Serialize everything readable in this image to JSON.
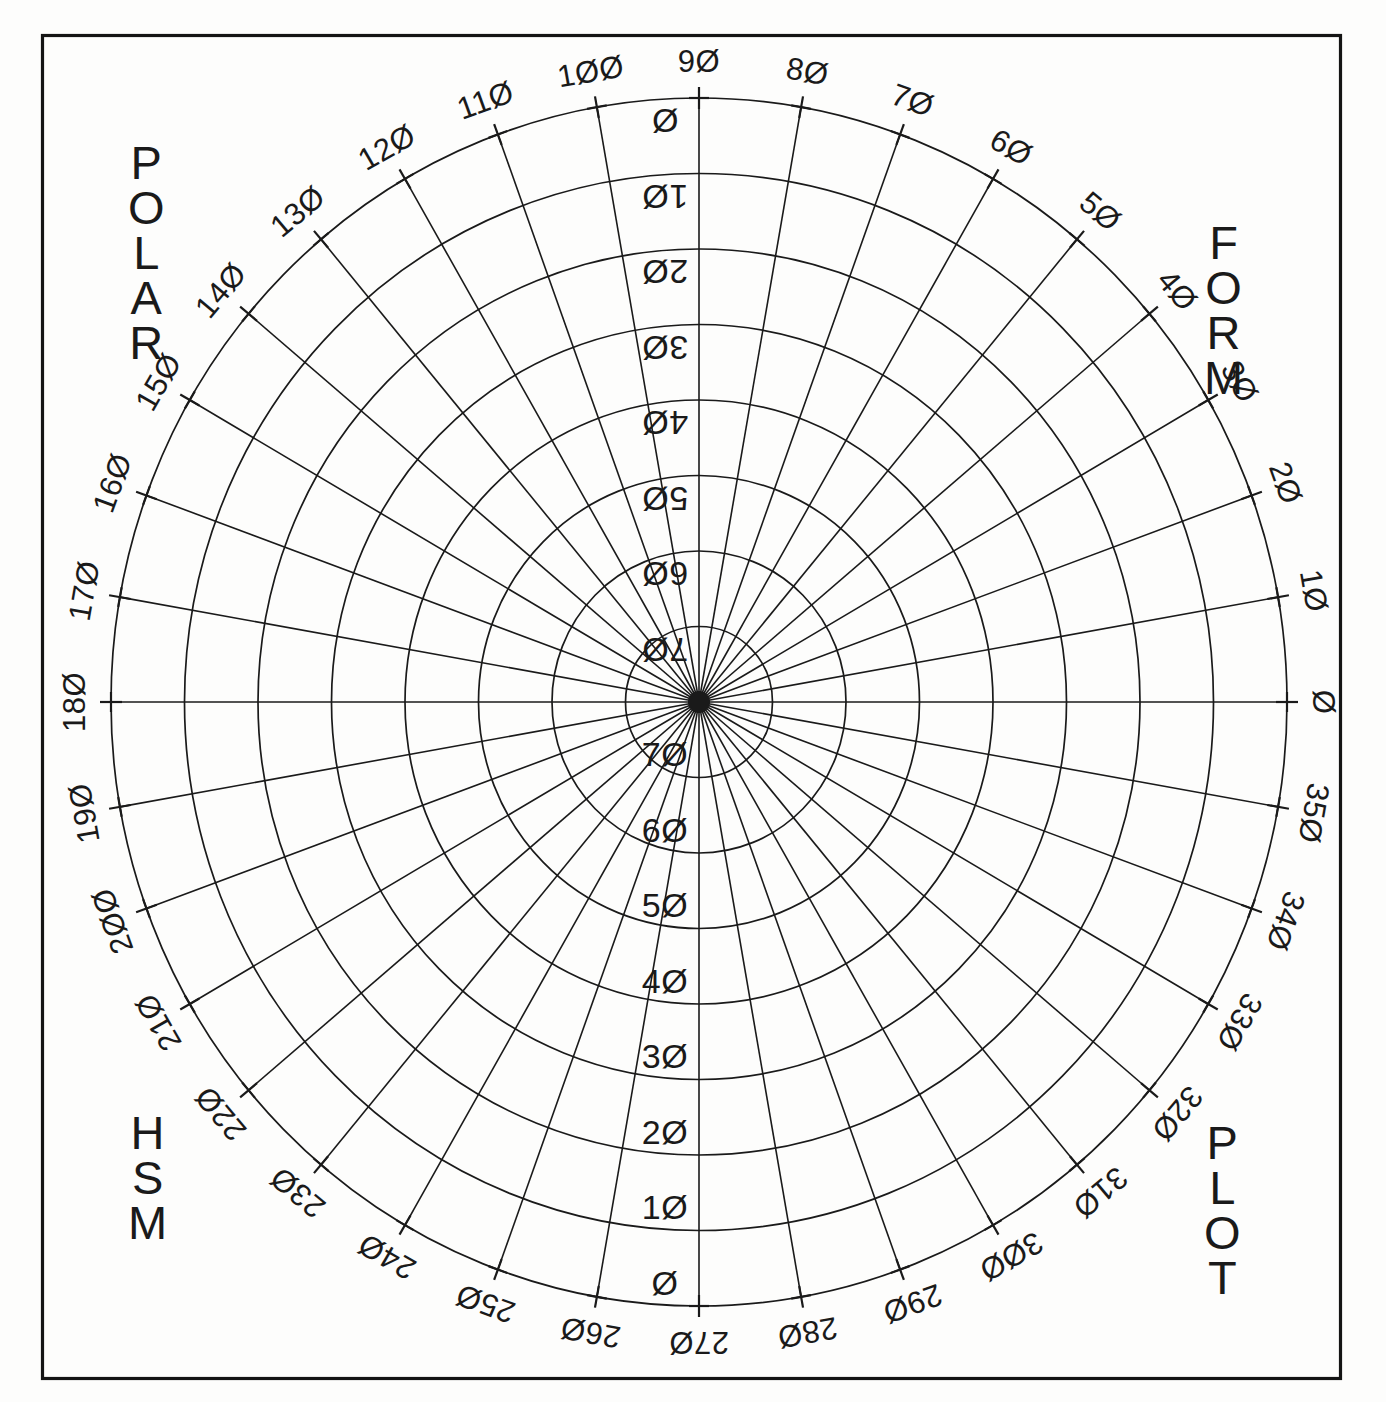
{
  "sheet": {
    "background_color": "#fdfdfc",
    "ink_color": "#1a1a1a",
    "border_color": "#141414"
  },
  "corner_labels": {
    "top_left": "POLAR",
    "top_right": "FORM",
    "bottom_left": "HSM",
    "bottom_right": "PLOT"
  },
  "chart_data": {
    "type": "line",
    "subtitle": "",
    "xlabel": "",
    "ylabel": "",
    "grid": true,
    "legend_position": "none",
    "projection": "polar",
    "center": {
      "x": 699,
      "y": 702
    },
    "radius_x": 588,
    "radius_y": 604,
    "angular_axis": {
      "label": "",
      "unit": "degrees",
      "range": [
        0,
        360
      ],
      "tick_step": 10,
      "zero_direction": "east",
      "direction": "counterclockwise",
      "tick_labels": [
        "0",
        "10",
        "20",
        "30",
        "40",
        "50",
        "60",
        "70",
        "80",
        "90",
        "100",
        "110",
        "120",
        "130",
        "140",
        "150",
        "160",
        "170",
        "180",
        "190",
        "200",
        "210",
        "220",
        "230",
        "240",
        "250",
        "260",
        "270",
        "280",
        "290",
        "300",
        "310",
        "320",
        "330",
        "340",
        "350"
      ]
    },
    "radial_axis": {
      "label": "",
      "range": [
        0,
        80
      ],
      "tick_step": 10,
      "ring_count": 8,
      "inner_to_outer_labels": [
        "70",
        "60",
        "50",
        "40",
        "30",
        "20",
        "10",
        "0"
      ],
      "lower_tick_labels": [
        "70",
        "60",
        "50",
        "40",
        "30",
        "20",
        "10",
        "0"
      ],
      "upper_tick_labels": [
        "70",
        "60",
        "50",
        "40",
        "30",
        "20",
        "10",
        "0"
      ],
      "upper_outer_extra_label": "270",
      "lower_outer_extra_label": "90"
    },
    "series": [],
    "values": [],
    "categories": []
  }
}
